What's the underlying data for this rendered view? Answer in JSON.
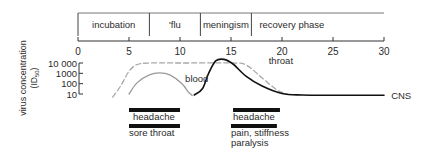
{
  "chart_data": {
    "type": "line",
    "title": "",
    "xlabel": "",
    "ylabel": "virus concentration (ID50)",
    "ylabel_main": "virus concentration",
    "ylabel_unit": "(ID",
    "ylabel_unit_sub": "50",
    "ylabel_unit_close": ")",
    "xlim": [
      0,
      30
    ],
    "x_ticks": [
      0,
      5,
      10,
      15,
      20,
      25,
      30
    ],
    "x_tick_labels": [
      "0",
      "5",
      "10",
      "15",
      "20",
      "25",
      "30"
    ],
    "y_scale": "log",
    "ylim_log10": [
      1,
      4
    ],
    "y_ticks_log10": [
      4,
      3,
      2,
      1
    ],
    "y_tick_labels": [
      "10 000",
      "1000",
      "100",
      "10"
    ],
    "grid": false,
    "phases": [
      {
        "label": "incubation",
        "start": 0,
        "end": 7
      },
      {
        "label": "'flu",
        "start": 7,
        "end": 12
      },
      {
        "label": "meningism",
        "start": 12,
        "end": 17
      },
      {
        "label": "recovery phase",
        "start": 17,
        "end": 30
      }
    ],
    "series": [
      {
        "name": "throat",
        "style": "dashed",
        "color": "#a8a8a8",
        "points": [
          [
            3.4,
            0.7
          ],
          [
            4.2,
            1.8
          ],
          [
            5.0,
            3.2
          ],
          [
            5.8,
            3.85
          ],
          [
            7,
            4.0
          ],
          [
            10,
            4.0
          ],
          [
            15,
            4.0
          ],
          [
            16.5,
            3.8
          ],
          [
            18,
            2.6
          ],
          [
            19.5,
            1.4
          ],
          [
            20.5,
            1.0
          ]
        ]
      },
      {
        "name": "blood",
        "style": "solid",
        "color": "#9a9a9a",
        "points": [
          [
            5.0,
            1.0
          ],
          [
            5.8,
            2.1
          ],
          [
            7.0,
            2.85
          ],
          [
            8.0,
            3.05
          ],
          [
            9.0,
            2.85
          ],
          [
            10.2,
            2.0
          ],
          [
            10.8,
            1.2
          ],
          [
            11.2,
            0.85
          ]
        ]
      },
      {
        "name": "CNS",
        "style": "solid",
        "color": "#111111",
        "points": [
          [
            11.4,
            0.9
          ],
          [
            12.2,
            1.5
          ],
          [
            12.8,
            3.0
          ],
          [
            13.5,
            4.2
          ],
          [
            14.3,
            4.35
          ],
          [
            15.2,
            3.9
          ],
          [
            16.5,
            2.7
          ],
          [
            18,
            1.8
          ],
          [
            20,
            1.05
          ],
          [
            22,
            0.9
          ],
          [
            25,
            0.88
          ],
          [
            30,
            0.88
          ]
        ]
      }
    ],
    "series_labels": [
      {
        "text": "blood",
        "x": 10.5,
        "y": 2.5
      },
      {
        "text": "throat",
        "x": 18.7,
        "y": 4.2
      },
      {
        "text": "CNS",
        "x": 30.7,
        "y": 0.88
      }
    ],
    "symptoms": [
      {
        "label_lines": [
          "headache"
        ],
        "start": 5,
        "end": 10,
        "row": 0
      },
      {
        "label_lines": [
          "sore throat"
        ],
        "start": 5,
        "end": 10,
        "row": 1
      },
      {
        "label_lines": [
          "headache"
        ],
        "start": 15.2,
        "end": 19.8,
        "row": 0
      },
      {
        "label_lines": [
          "pain, stiffness",
          "paralysis"
        ],
        "start": 15.0,
        "end": 19.5,
        "row": 1
      }
    ]
  }
}
